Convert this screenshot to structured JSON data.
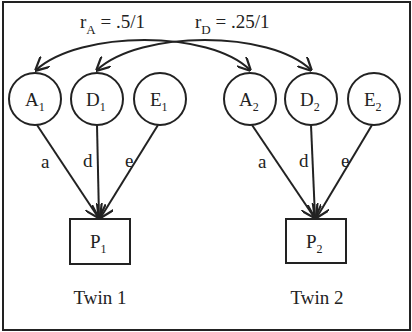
{
  "correlations": {
    "rA": {
      "symbol": "r",
      "sub": "A",
      "value": " = .5/1"
    },
    "rD": {
      "symbol": "r",
      "sub": "D",
      "value": " = .25/1"
    }
  },
  "latents": [
    {
      "id": "A1",
      "letter": "A",
      "sub": "1",
      "cx": 35,
      "path": "a"
    },
    {
      "id": "D1",
      "letter": "D",
      "sub": "1",
      "cx": 97,
      "path": "d"
    },
    {
      "id": "E1",
      "letter": "E",
      "sub": "1",
      "cx": 160,
      "path": "e"
    },
    {
      "id": "A2",
      "letter": "A",
      "sub": "2",
      "cx": 250,
      "path": "a"
    },
    {
      "id": "D2",
      "letter": "D",
      "sub": "2",
      "cx": 311,
      "path": "d"
    },
    {
      "id": "E2",
      "letter": "E",
      "sub": "2",
      "cx": 374,
      "path": "e"
    }
  ],
  "phenotypes": [
    {
      "id": "P1",
      "letter": "P",
      "sub": "1"
    },
    {
      "id": "P2",
      "letter": "P",
      "sub": "2"
    }
  ],
  "path_labels": {
    "a": "a",
    "d": "d",
    "e": "e"
  },
  "twins": {
    "twin1": "Twin 1",
    "twin2": "Twin 2"
  },
  "colors": {
    "stroke": "#222222",
    "background": "#ffffff"
  }
}
